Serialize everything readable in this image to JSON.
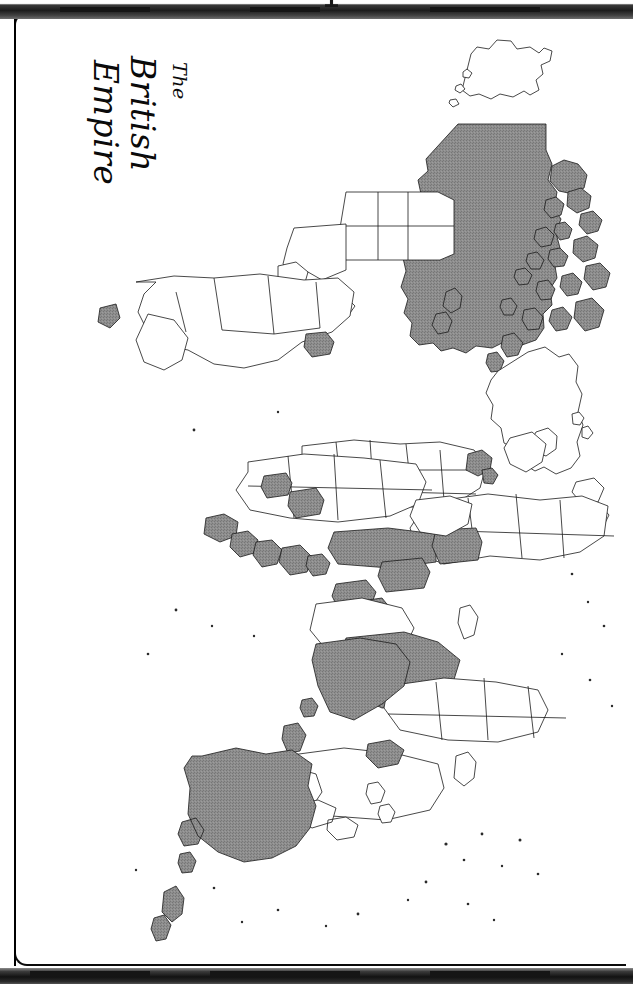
{
  "document": {
    "kind": "scanned-book-page",
    "title_lines": [
      "The",
      "British",
      "Empire"
    ],
    "title_full": "The British Empire",
    "title_orientation": "rotated-90-clockwise",
    "map_orientation": "rotated-90-clockwise",
    "page_background": "#ffffff",
    "frame_color": "#0b0b0b",
    "scanbar_color": "#1d1d1d"
  },
  "map": {
    "name": "world-map",
    "projection": "equirectangular",
    "shaded_fill": "#8a8a8a",
    "unshaded_fill": "#ffffff",
    "outline_color": "#1a1a1a",
    "legend_note": "Shaded areas denote territories of the British Empire",
    "shaded_territories": [
      "Canada",
      "Newfoundland",
      "British Guiana",
      "Falkland Islands",
      "United Kingdom",
      "Ireland",
      "Gibraltar",
      "Malta",
      "Cyprus",
      "Egypt",
      "Sudan",
      "Nigeria",
      "Ghana",
      "Sierra Leone",
      "Gambia",
      "Kenya",
      "Uganda",
      "Tanganyika",
      "Northern Rhodesia",
      "Southern Rhodesia",
      "Nyasaland",
      "Bechuanaland",
      "South Africa",
      "India",
      "Ceylon",
      "Burma",
      "Malaya",
      "Australia",
      "New Zealand",
      "Papua New Guinea"
    ],
    "unshaded_note": "All other nations shown in outline only"
  }
}
